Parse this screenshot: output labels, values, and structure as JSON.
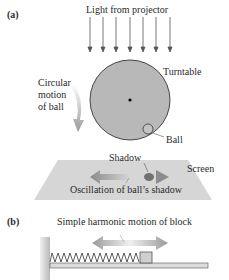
{
  "panel_a": {
    "label": "(a)",
    "light_label": "Light from projector",
    "turntable_label": "Turntable",
    "circular_motion_label_line1": "Circular",
    "circular_motion_label_line2": "motion",
    "circular_motion_label_line3": "of ball",
    "ball_label": "Ball",
    "shadow_label": "Shadow",
    "screen_label": "Screen",
    "oscillation_label": "Oscillation of ball’s shadow",
    "light_arrow_count": 7
  },
  "panel_b": {
    "label": "(b)",
    "motion_label": "Simple harmonic motion of block"
  },
  "colors": {
    "turntable_fill": "#b8b8b8",
    "turntable_stroke": "#333333",
    "screen_fill": "#d6d6d6",
    "arrow_gray": "#8c8c8c",
    "shadow_dot": "#707070",
    "wall": "#c4c4c4",
    "rail": "#d9d9d9",
    "block": "#cfcfcf"
  }
}
